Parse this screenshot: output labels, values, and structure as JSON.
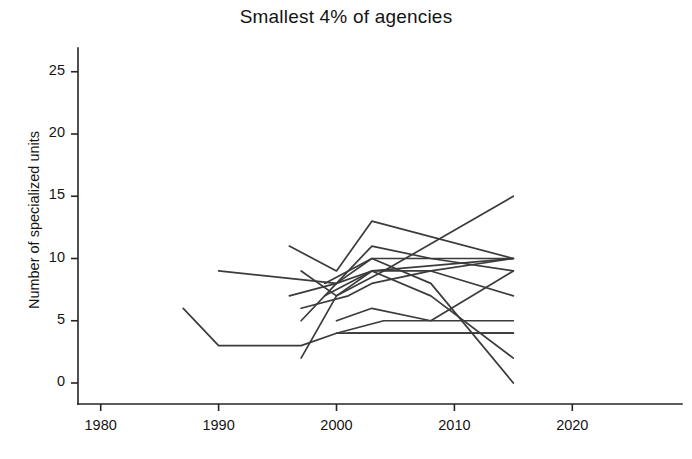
{
  "chart_data": {
    "type": "line",
    "title": "Smallest 4% of agencies",
    "subtitle": "",
    "xlabel": "",
    "ylabel": "Number of specialized units",
    "xlim": [
      1975,
      2022
    ],
    "ylim": [
      -1.5,
      27
    ],
    "xticks": [
      1980,
      1990,
      2000,
      2010,
      2020
    ],
    "xtick_labels": [
      "1980",
      "1990",
      "2000",
      "2010",
      "2020"
    ],
    "yticks": [
      0,
      5,
      10,
      15,
      20,
      25
    ],
    "ytick_labels": [
      "0",
      "5",
      "10",
      "15",
      "20",
      "25"
    ],
    "grid": false,
    "legend": "none",
    "line_color": "#3b3b3b",
    "axis_color": "#242424",
    "series": [
      {
        "name": "agency-1",
        "x": [
          1987,
          1990,
          1997,
          2000,
          2003,
          2007,
          2011,
          2015
        ],
        "values": [
          6,
          3,
          3,
          4,
          4,
          4,
          4,
          4
        ]
      },
      {
        "name": "agency-2",
        "x": [
          1990,
          2000,
          2003,
          2015
        ],
        "values": [
          9,
          8,
          9,
          10
        ]
      },
      {
        "name": "agency-3",
        "x": [
          1996,
          2000,
          2003,
          2015
        ],
        "values": [
          11,
          9,
          13,
          10
        ]
      },
      {
        "name": "agency-4",
        "x": [
          1996,
          2000,
          2003,
          2008,
          2015
        ],
        "values": [
          7,
          8,
          11,
          10,
          9
        ]
      },
      {
        "name": "agency-5",
        "x": [
          1997,
          2000,
          2003,
          2015
        ],
        "values": [
          5,
          8,
          10,
          10
        ]
      },
      {
        "name": "agency-6",
        "x": [
          1997,
          2000,
          2003,
          2008,
          2015
        ],
        "values": [
          9,
          7,
          9,
          9,
          7
        ]
      },
      {
        "name": "agency-7",
        "x": [
          1997,
          2001,
          2003,
          2008,
          2015
        ],
        "values": [
          6,
          7,
          8,
          9,
          10
        ]
      },
      {
        "name": "agency-8",
        "x": [
          1997,
          2000,
          2004,
          2015
        ],
        "values": [
          2,
          7,
          9,
          15
        ]
      },
      {
        "name": "agency-9",
        "x": [
          1999,
          2003,
          2008,
          2015
        ],
        "values": [
          8,
          10,
          8,
          0
        ]
      },
      {
        "name": "agency-10",
        "x": [
          1999,
          2003,
          2008,
          2015
        ],
        "values": [
          7,
          9,
          7,
          2
        ]
      },
      {
        "name": "agency-11",
        "x": [
          2000,
          2003,
          2008,
          2015
        ],
        "values": [
          5,
          6,
          5,
          5
        ]
      },
      {
        "name": "agency-12",
        "x": [
          2000,
          2004,
          2008,
          2015
        ],
        "values": [
          4,
          5,
          5,
          9
        ]
      },
      {
        "name": "agency-13",
        "x": [
          2001,
          2004,
          2009,
          2015
        ],
        "values": [
          4,
          4,
          4,
          4
        ]
      }
    ]
  },
  "axes": {
    "tick_length": 7
  }
}
